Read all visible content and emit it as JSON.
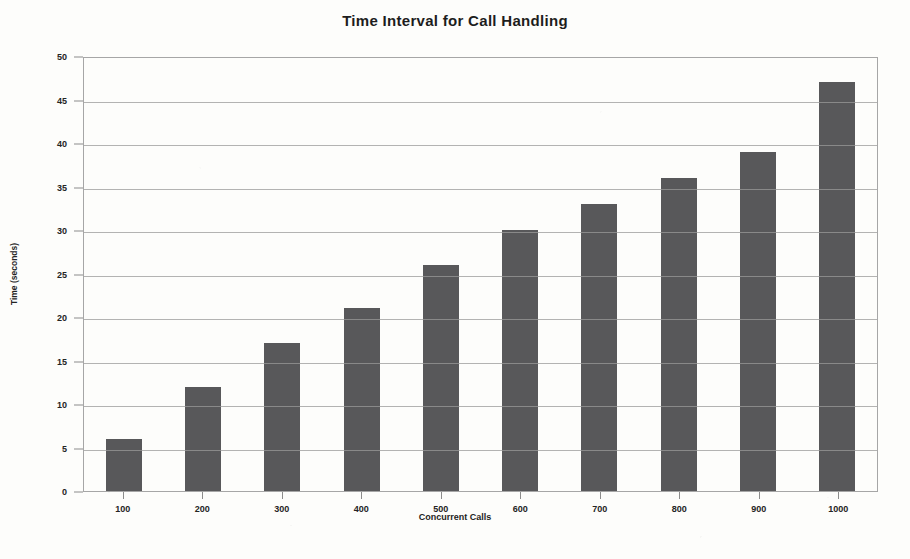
{
  "chart_data": {
    "type": "bar",
    "title": "Time Interval for Call Handling",
    "xlabel": "Concurrent Calls",
    "ylabel": "Time (seconds)",
    "categories": [
      "100",
      "200",
      "300",
      "400",
      "500",
      "600",
      "700",
      "800",
      "900",
      "1000"
    ],
    "values": [
      6,
      12,
      17,
      21,
      26,
      30,
      33,
      36,
      39,
      47
    ],
    "ylim": [
      0,
      50
    ],
    "ytick_labels": [
      "50",
      "45",
      "40",
      "35",
      "30",
      "25",
      "20",
      "15",
      "10",
      "5",
      "0"
    ],
    "ytick_values": [
      50,
      45,
      40,
      35,
      30,
      25,
      20,
      15,
      10,
      5,
      0
    ],
    "grid": true,
    "legend": "none",
    "bar_color": "#58585a",
    "grid_color": "#9a9a9a",
    "axis_color": "#a6a6a6",
    "background_color": "#fdfdfb",
    "text_color": "#1d1d1d"
  }
}
